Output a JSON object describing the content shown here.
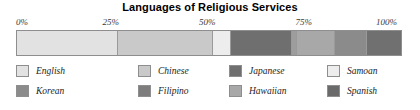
{
  "chart_data": {
    "type": "bar",
    "orientation": "horizontal",
    "stacked": true,
    "title": "Languages of Religious Services",
    "xlabel": "",
    "ylabel": "",
    "xlim": [
      0,
      100
    ],
    "grid": false,
    "legend_position": "bottom",
    "tick_labels": [
      "0%",
      "25%",
      "50%",
      "75%",
      "100%"
    ],
    "tick_values": [
      0,
      25,
      50,
      75,
      100
    ],
    "categories": [
      "English",
      "Chinese",
      "Samoan",
      "Japanese",
      "Korean",
      "Hawaiian",
      "Filipino",
      "Spanish"
    ],
    "values": [
      26.2,
      24.9,
      4.7,
      15.8,
      1.3,
      9.8,
      8.5,
      8.8
    ],
    "colors": [
      "#e2e2e2",
      "#c9c9c9",
      "#ededed",
      "#6f6f6f",
      "#9d9d9d",
      "#a8a8a8",
      "#8b8b8b",
      "#707070"
    ],
    "segments": [
      {
        "label": "English",
        "value": 26.2,
        "color": "#e2e2e2"
      },
      {
        "label": "Chinese",
        "value": 24.9,
        "color": "#c9c9c9"
      },
      {
        "label": "Samoan",
        "value": 4.7,
        "color": "#ededed"
      },
      {
        "label": "Japanese",
        "value": 15.8,
        "color": "#6f6f6f"
      },
      {
        "label": "Korean",
        "value": 1.3,
        "color": "#9d9d9d"
      },
      {
        "label": "Hawaiian",
        "value": 9.8,
        "color": "#a8a8a8"
      },
      {
        "label": "Filipino",
        "value": 8.5,
        "color": "#8b8b8b"
      },
      {
        "label": "Spanish",
        "value": 8.8,
        "color": "#707070"
      }
    ]
  },
  "legend": {
    "items": [
      {
        "label": "English",
        "color": "#e2e2e2"
      },
      {
        "label": "Korean",
        "color": "#8b8b8b"
      },
      {
        "label": "Chinese",
        "color": "#c9c9c9"
      },
      {
        "label": "Filipino",
        "color": "#7d7d7d"
      },
      {
        "label": "Japanese",
        "color": "#6f6f6f"
      },
      {
        "label": "Hawaiian",
        "color": "#a8a8a8"
      },
      {
        "label": "Samoan",
        "color": "#ededed"
      },
      {
        "label": "Spanish",
        "color": "#6a6a6a"
      }
    ]
  }
}
